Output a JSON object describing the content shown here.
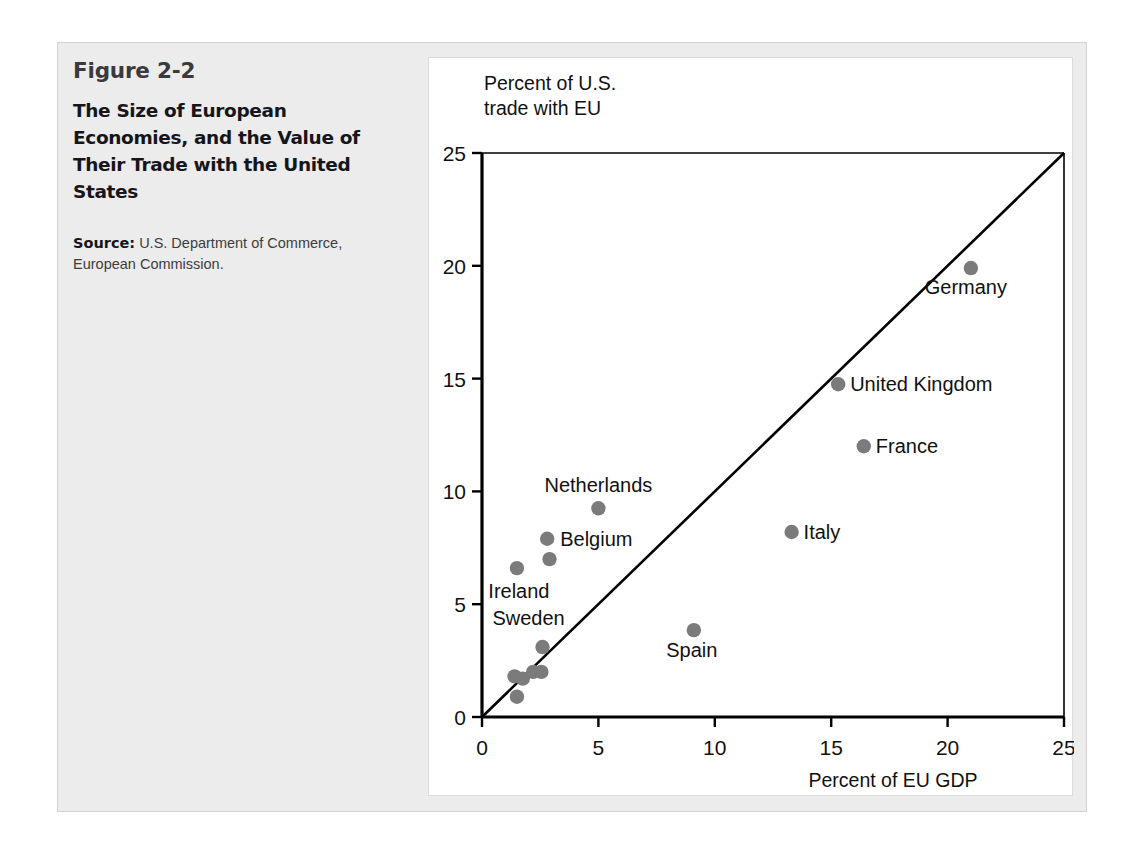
{
  "figure": {
    "number": "Figure 2-2",
    "title": "The Size of European Economies, and the Value of Their Trade with the United States",
    "source_lead": "Source:",
    "source_text": " U.S. Department of Commerce, European Commission."
  },
  "colors": {
    "frame_background": "#ececed",
    "panel_background": "#ffffff",
    "point_fill": "#7b7b7b",
    "axis_line": "#000000",
    "text": "#111111"
  },
  "chart_data": {
    "type": "scatter",
    "title": "",
    "xlabel": "Percent of EU GDP",
    "ylabel": "Percent of U.S. trade with EU",
    "xlim": [
      0,
      25
    ],
    "ylim": [
      0,
      25
    ],
    "xticks": [
      0,
      5,
      10,
      15,
      20,
      25
    ],
    "yticks": [
      0,
      5,
      10,
      15,
      20,
      25
    ],
    "xtick_labels": [
      "0",
      "5",
      "10",
      "15",
      "20",
      "25"
    ],
    "ytick_labels": [
      "0",
      "5",
      "10",
      "15",
      "20",
      "25"
    ],
    "grid": false,
    "legend": false,
    "reference_line": {
      "name": "45-degree line",
      "from": [
        0,
        0
      ],
      "to": [
        25,
        25
      ]
    },
    "points": [
      {
        "label": "Germany",
        "x": 21.0,
        "y": 19.9,
        "label_dx": -5,
        "label_dy": 26,
        "label_anchor": "middle"
      },
      {
        "label": "United Kingdom",
        "x": 15.3,
        "y": 14.75,
        "label_dx": 12,
        "label_dy": 7,
        "label_anchor": "start"
      },
      {
        "label": "France",
        "x": 16.4,
        "y": 12.0,
        "label_dx": 12,
        "label_dy": 7,
        "label_anchor": "start"
      },
      {
        "label": "Italy",
        "x": 13.3,
        "y": 8.2,
        "label_dx": 12,
        "label_dy": 7,
        "label_anchor": "start"
      },
      {
        "label": "Spain",
        "x": 9.1,
        "y": 3.85,
        "label_dx": -2,
        "label_dy": 27,
        "label_anchor": "middle"
      },
      {
        "label": "Netherlands",
        "x": 5.0,
        "y": 9.25,
        "label_dx": 0,
        "label_dy": -16,
        "label_anchor": "middle"
      },
      {
        "label": "Belgium",
        "x": 2.8,
        "y": 7.9,
        "label_dx": 13,
        "label_dy": 7,
        "label_anchor": "start"
      },
      {
        "label": "",
        "x": 2.9,
        "y": 7.0,
        "label_dx": 0,
        "label_dy": 0,
        "label_anchor": "middle"
      },
      {
        "label": "Ireland",
        "x": 1.5,
        "y": 6.6,
        "label_dx": 2,
        "label_dy": 30,
        "label_anchor": "middle"
      },
      {
        "label": "Sweden",
        "x": 2.6,
        "y": 3.1,
        "label_dx": -14,
        "label_dy": -22,
        "label_anchor": "middle"
      },
      {
        "label": "",
        "x": 1.4,
        "y": 1.8,
        "label_dx": 0,
        "label_dy": 0,
        "label_anchor": "middle"
      },
      {
        "label": "",
        "x": 1.75,
        "y": 1.7,
        "label_dx": 0,
        "label_dy": 0,
        "label_anchor": "middle"
      },
      {
        "label": "",
        "x": 2.2,
        "y": 2.0,
        "label_dx": 0,
        "label_dy": 0,
        "label_anchor": "middle"
      },
      {
        "label": "",
        "x": 2.55,
        "y": 2.0,
        "label_dx": 0,
        "label_dy": 0,
        "label_anchor": "middle"
      },
      {
        "label": "",
        "x": 1.5,
        "y": 0.9,
        "label_dx": 0,
        "label_dy": 0,
        "label_anchor": "middle"
      }
    ]
  },
  "axis_label_lines": {
    "y_line1": "Percent of U.S.",
    "y_line2": "trade with EU",
    "x_line": "Percent of EU GDP"
  }
}
